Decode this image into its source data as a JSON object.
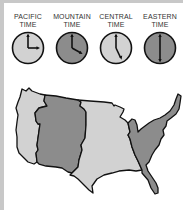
{
  "figure": {
    "colors": {
      "light_zone": "#d2d2d2",
      "dark_zone": "#8c8c8c",
      "outline": "#111111",
      "border": "#c8c8c8"
    }
  },
  "clocks": [
    {
      "line1": "PACIFIC",
      "line2": "TIME",
      "time": "3:00",
      "hour": 3,
      "minute": 0,
      "shade": "light"
    },
    {
      "line1": "MOUNTAIN",
      "line2": "TIME",
      "time": "4:00",
      "hour": 4,
      "minute": 0,
      "shade": "dark"
    },
    {
      "line1": "CENTRAL",
      "line2": "TIME",
      "time": "5:00",
      "hour": 5,
      "minute": 0,
      "shade": "light"
    },
    {
      "line1": "EASTERN",
      "line2": "TIME",
      "time": "6:00",
      "hour": 6,
      "minute": 0,
      "shade": "dark"
    }
  ],
  "map": {
    "regions": [
      {
        "name": "Pacific",
        "shade": "light"
      },
      {
        "name": "Mountain",
        "shade": "dark"
      },
      {
        "name": "Central",
        "shade": "light"
      },
      {
        "name": "Eastern",
        "shade": "dark"
      }
    ]
  }
}
